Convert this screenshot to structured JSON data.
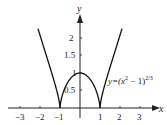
{
  "chart_data": {
    "type": "line",
    "title": "",
    "xlabel": "x",
    "ylabel": "y",
    "function": "y=(x^2-1)^(2/3)",
    "annotation": "y=(x²−1)^{2/3}",
    "xlim": [
      -3.5,
      3.8
    ],
    "ylim": [
      0,
      2.6
    ],
    "x_ticks": [
      -3,
      -2,
      -1,
      1,
      2,
      3
    ],
    "x_tick_labels": [
      "−3",
      "−2",
      "−1",
      "1",
      "2",
      "3"
    ],
    "y_ticks": [
      0.5,
      1,
      1.5,
      2
    ],
    "y_tick_labels": [
      "0.5",
      "1",
      "1.5",
      "2"
    ],
    "series": [
      {
        "name": "y=(x^2-1)^(2/3)",
        "x": [
          -2.1,
          -2,
          -1.5,
          -1.2,
          -1,
          -0.75,
          -0.5,
          -0.25,
          0,
          0.25,
          0.5,
          0.75,
          1,
          1.2,
          1.5,
          2,
          2.1
        ],
        "values": [
          2.27,
          2.08,
          1.16,
          0.58,
          0,
          0.62,
          0.83,
          0.96,
          1,
          0.96,
          0.83,
          0.62,
          0,
          0.58,
          1.16,
          2.08,
          2.27
        ]
      }
    ],
    "cusps": [
      [
        -1,
        0
      ],
      [
        1,
        0
      ]
    ],
    "grid": false,
    "legend": "none"
  },
  "labels": {
    "x_axis": "x",
    "y_axis": "y",
    "equation_prefix": "y=(x",
    "equation_sup1": "2",
    "equation_mid": " − 1)",
    "equation_sup2": "2/3",
    "xticks": [
      "−3",
      "−2",
      "−1",
      "1",
      "2",
      "3"
    ],
    "yticks": [
      "0.5",
      "1",
      "1.5",
      "2"
    ]
  }
}
